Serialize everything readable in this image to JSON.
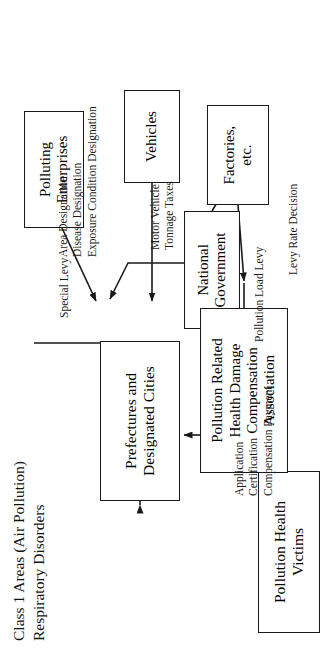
{
  "figure": {
    "title": "Class 1 Areas (Air Pollution)\nRespiratory Disorders",
    "orientation_note": "rotated-90-ccw"
  },
  "nodes": {
    "national_government": "National\nGovernment",
    "prefectures": "Prefectures and\nDesignated Cities",
    "victims": "Pollution Health Victims",
    "association": "Pollution Related\nHealth Damage\nCompensation\nAssociation",
    "factories": "Factories,\netc.",
    "vehicles": "Vehicles",
    "polluting_enterprises": "Polluting\nEnterprises"
  },
  "edge_labels": {
    "designations": "Area Designation\nDisease Designation\nExposure Condition Designation",
    "pollution_load_levy": "Pollution Load Levy",
    "levy_rate_decision": "Levy Rate Decision",
    "motor_vehicle_tonnage_taxes": "Motor Vehicle\nTonnage Taxes",
    "special_levy": "Special Levy",
    "application_certification_compensation": "Application\nCertification\nCompensation Payment"
  },
  "colors": {
    "stroke": "#1a1a1a",
    "background": "#ffffff",
    "text": "#000000"
  }
}
